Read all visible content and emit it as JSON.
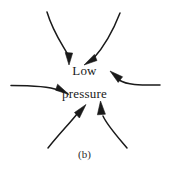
{
  "figure": {
    "caption": "(b)",
    "center_label_line1": "Low",
    "center_label_line2": "pressure",
    "stroke_color": "#1a1a1a",
    "background_color": "#ffffff"
  },
  "diagram_data": {
    "type": "vector-field-schematic",
    "description": "Six curved inflow arrows converging on a central low pressure center",
    "arrows": [
      {
        "name": "top-left-inflow",
        "path": "M47,12 C53,32 62,44 68,55",
        "head_point": [
          69,
          63
        ],
        "head_angle_deg": 80
      },
      {
        "name": "top-right-inflow",
        "path": "M120,13 C112,30 102,48 92,60",
        "head_point": [
          86,
          64
        ],
        "head_angle_deg": 205
      },
      {
        "name": "left-inflow",
        "path": "M11,86 C32,86 48,86 58,90",
        "head_point": [
          67,
          93
        ],
        "head_angle_deg": 20
      },
      {
        "name": "right-inflow",
        "path": "M160,85 C142,85 128,85 119,80",
        "head_point": [
          111,
          73
        ],
        "head_angle_deg": 220
      },
      {
        "name": "bottom-left-inflow",
        "path": "M48,148 C60,133 70,122 77,114",
        "head_point": [
          84,
          106
        ],
        "head_angle_deg": 312
      },
      {
        "name": "bottom-right-inflow",
        "path": "M127,148 C115,134 106,124 102,115",
        "head_point": [
          100,
          103
        ],
        "head_angle_deg": 260
      }
    ]
  }
}
